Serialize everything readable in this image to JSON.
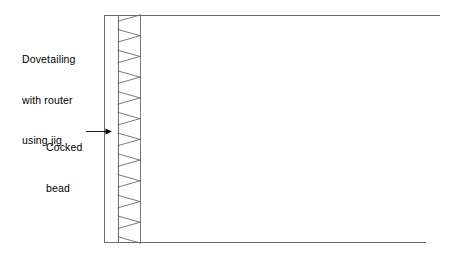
{
  "figure": {
    "name": "dovetail-joint-with-cocked-bead-diagram",
    "background_color": "#ffffff",
    "width": 457,
    "height": 267
  },
  "labels": {
    "dovetailing": {
      "name": "dovetailing-with-router-using-jig",
      "lines": [
        "Dovetailing",
        "with router",
        "using jig"
      ],
      "full_text": "Dovetailing with router using jig"
    },
    "cocked_bead": {
      "name": "cocked-bead",
      "lines": [
        "Cocked",
        "bead"
      ],
      "full_text": "Cocked bead"
    }
  },
  "leader": {
    "name": "cocked-bead-leader-arrow",
    "from_x": 86,
    "to_x": 112,
    "y": 131,
    "arrowhead": "right"
  },
  "geometry": {
    "panel": {
      "name": "workpiece-panel",
      "top_y": 15,
      "bottom_y": 243,
      "left_x": 104,
      "top_right_x": 440,
      "bottom_right_x": 426
    },
    "bead_strip": {
      "name": "cocked-bead-strip",
      "left_x": 104,
      "right_x": 118,
      "top_y": 15,
      "bottom_y": 243
    },
    "dovetail_field": {
      "name": "dovetail-pin-field",
      "base_x": 118,
      "tip_x": 140,
      "top_y": 15,
      "bottom_y": 243,
      "count": 11,
      "pitch": 20.7,
      "narrow_at": "base",
      "wide_at": "tip"
    }
  },
  "style": {
    "line_color": "#6b6b6b",
    "dark_line_color": "#555555",
    "text_color": "#000000",
    "stroke_width": 0.9
  }
}
